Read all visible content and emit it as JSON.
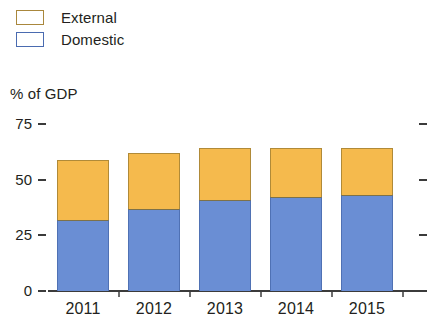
{
  "legend": {
    "items": [
      {
        "label": "External",
        "color": "#F5BA4D",
        "swatch_name": "legend-swatch-external"
      },
      {
        "label": "Domestic",
        "color": "#6A8ED4",
        "swatch_name": "legend-swatch-domestic"
      }
    ]
  },
  "axis_caption": "% of GDP",
  "chart_data": {
    "type": "bar",
    "stacked": true,
    "title": "",
    "subtitle": "",
    "xlabel": "",
    "ylabel": "% of GDP",
    "categories": [
      "2011",
      "2012",
      "2013",
      "2014",
      "2015"
    ],
    "series": [
      {
        "name": "Domestic",
        "color": "#6A8ED4",
        "values": [
          32,
          37,
          41,
          42,
          43
        ]
      },
      {
        "name": "External",
        "color": "#F5BA4D",
        "values": [
          27,
          25,
          23,
          22,
          21
        ]
      }
    ],
    "totals": [
      59,
      62,
      64,
      64,
      64
    ],
    "ylim": [
      0,
      75
    ],
    "yticks": [
      0,
      25,
      50,
      75
    ],
    "ytick_labels": [
      "0",
      "25",
      "50",
      "75"
    ],
    "grid": false,
    "legend_position": "top-left",
    "annotations": []
  }
}
